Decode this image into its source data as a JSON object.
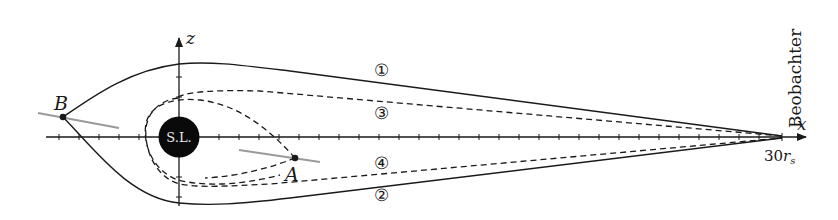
{
  "figure": {
    "colors": {
      "ink": "#1a1a1a",
      "grey_line": "#9a9a9a",
      "background": "#ffffff",
      "hole_text": "#e8e8e8"
    },
    "axes": {
      "x_label": "x",
      "z_label": "z",
      "x_end_label_value": "30",
      "x_end_label_unit": "r",
      "x_end_label_subscript": "s",
      "tick_spacing_px": 20
    },
    "black_hole": {
      "label": "S.L."
    },
    "observer": {
      "label": "Beobachter"
    },
    "points": {
      "A": {
        "label": "A"
      },
      "B": {
        "label": "B"
      }
    },
    "paths": [
      {
        "id": "1",
        "label": "①",
        "style": "solid"
      },
      {
        "id": "2",
        "label": "②",
        "style": "solid"
      },
      {
        "id": "3",
        "label": "③",
        "style": "dashed"
      },
      {
        "id": "4",
        "label": "④",
        "style": "dashed"
      }
    ]
  }
}
